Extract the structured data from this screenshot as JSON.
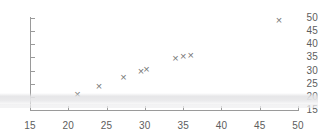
{
  "chart_data": {
    "type": "scatter",
    "title": "",
    "subtitle": "",
    "xlabel": "",
    "ylabel": "",
    "xlim": [
      15,
      50
    ],
    "ylim": [
      15,
      50
    ],
    "xticks": [
      15,
      20,
      25,
      30,
      35,
      40,
      45,
      50
    ],
    "yticks": [
      15,
      20,
      25,
      30,
      35,
      40,
      45,
      50
    ],
    "xtick_labels": [
      "15",
      "20",
      "25",
      "30",
      "35",
      "40",
      "45",
      "50"
    ],
    "ytick_labels": [
      "15",
      "20",
      "25",
      "30",
      "35",
      "40",
      "45",
      "50"
    ],
    "grid": false,
    "legend": null,
    "marker": "x",
    "marker_color": "#787878",
    "axis_color": "#9a9a9a",
    "background": "#ffffff",
    "points": [
      {
        "x": 21.2,
        "y": 21.0
      },
      {
        "x": 24.0,
        "y": 24.0
      },
      {
        "x": 27.2,
        "y": 27.5
      },
      {
        "x": 29.5,
        "y": 29.5
      },
      {
        "x": 30.2,
        "y": 30.5
      },
      {
        "x": 34.0,
        "y": 34.5
      },
      {
        "x": 35.0,
        "y": 35.3
      },
      {
        "x": 36.0,
        "y": 35.8
      },
      {
        "x": 47.5,
        "y": 49.0
      }
    ]
  }
}
